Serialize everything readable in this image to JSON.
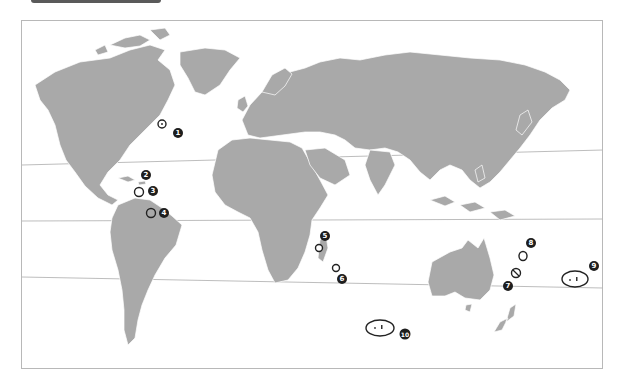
{
  "map": {
    "colors": {
      "land": "#a9a9a9",
      "border": "#ffffff",
      "lines": "#b5b5b5",
      "marker": "#1e1e1e"
    },
    "reference_lines": [
      {
        "name": "tropic-of-cancer"
      },
      {
        "name": "equator"
      },
      {
        "name": "tropic-of-capricorn"
      }
    ],
    "markers": [
      {
        "number": "1",
        "location": "Bermuda"
      },
      {
        "number": "2",
        "location": "Caribbean (north)"
      },
      {
        "number": "3",
        "location": "Caribbean (Lesser Antilles)"
      },
      {
        "number": "4",
        "location": "Guiana coast"
      },
      {
        "number": "5",
        "location": "Comoros"
      },
      {
        "number": "6",
        "location": "Mauritius / Réunion"
      },
      {
        "number": "7",
        "location": "New Caledonia"
      },
      {
        "number": "8",
        "location": "Vanuatu"
      },
      {
        "number": "9",
        "location": "French Polynesia / Cook Islands"
      },
      {
        "number": "10",
        "location": "Southern Pacific islands"
      }
    ]
  }
}
